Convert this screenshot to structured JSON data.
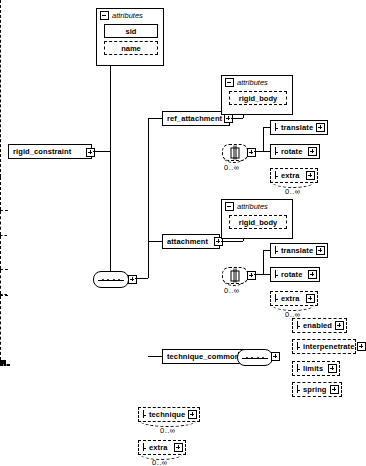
{
  "diagram": {
    "title": "rigid_constraint",
    "type": "xml-schema-tree"
  },
  "root": {
    "label": "rigid_constraint",
    "expander": "plus-icon"
  },
  "attributes_top": {
    "header": "attributes",
    "items": [
      {
        "label": "sid",
        "required": true
      },
      {
        "label": "name",
        "required": false
      }
    ]
  },
  "branches": [
    {
      "id": "ref_attachment",
      "label": "ref_attachment",
      "attributes": {
        "header": "attributes",
        "items": [
          {
            "label": "rigid_body",
            "required": false
          }
        ]
      },
      "choice_cardinality": "0..∞",
      "children": [
        {
          "label": "translate",
          "required": true,
          "cardinality": ""
        },
        {
          "label": "rotate",
          "required": true,
          "cardinality": ""
        },
        {
          "label": "extra",
          "required": false,
          "cardinality": "0..∞"
        }
      ]
    },
    {
      "id": "attachment",
      "label": "attachment",
      "attributes": {
        "header": "attributes",
        "items": [
          {
            "label": "rigid_body",
            "required": false
          }
        ]
      },
      "choice_cardinality": "0..∞",
      "children": [
        {
          "label": "translate",
          "required": true,
          "cardinality": ""
        },
        {
          "label": "rotate",
          "required": true,
          "cardinality": ""
        },
        {
          "label": "extra",
          "required": false,
          "cardinality": "0..∞"
        }
      ]
    },
    {
      "id": "technique_common",
      "label": "technique_common",
      "children": [
        {
          "label": "enabled",
          "required": false,
          "cardinality": ""
        },
        {
          "label": "interpenetrate",
          "required": false,
          "cardinality": ""
        },
        {
          "label": "limits",
          "required": false,
          "cardinality": ""
        },
        {
          "label": "spring",
          "required": false,
          "cardinality": ""
        }
      ]
    }
  ],
  "tail": [
    {
      "label": "technique",
      "required": false,
      "cardinality": "0..∞"
    },
    {
      "label": "extra",
      "required": false,
      "cardinality": "0..∞"
    }
  ],
  "colors": {
    "line": "#000000",
    "background": "#ffffff",
    "text": "#000000"
  }
}
